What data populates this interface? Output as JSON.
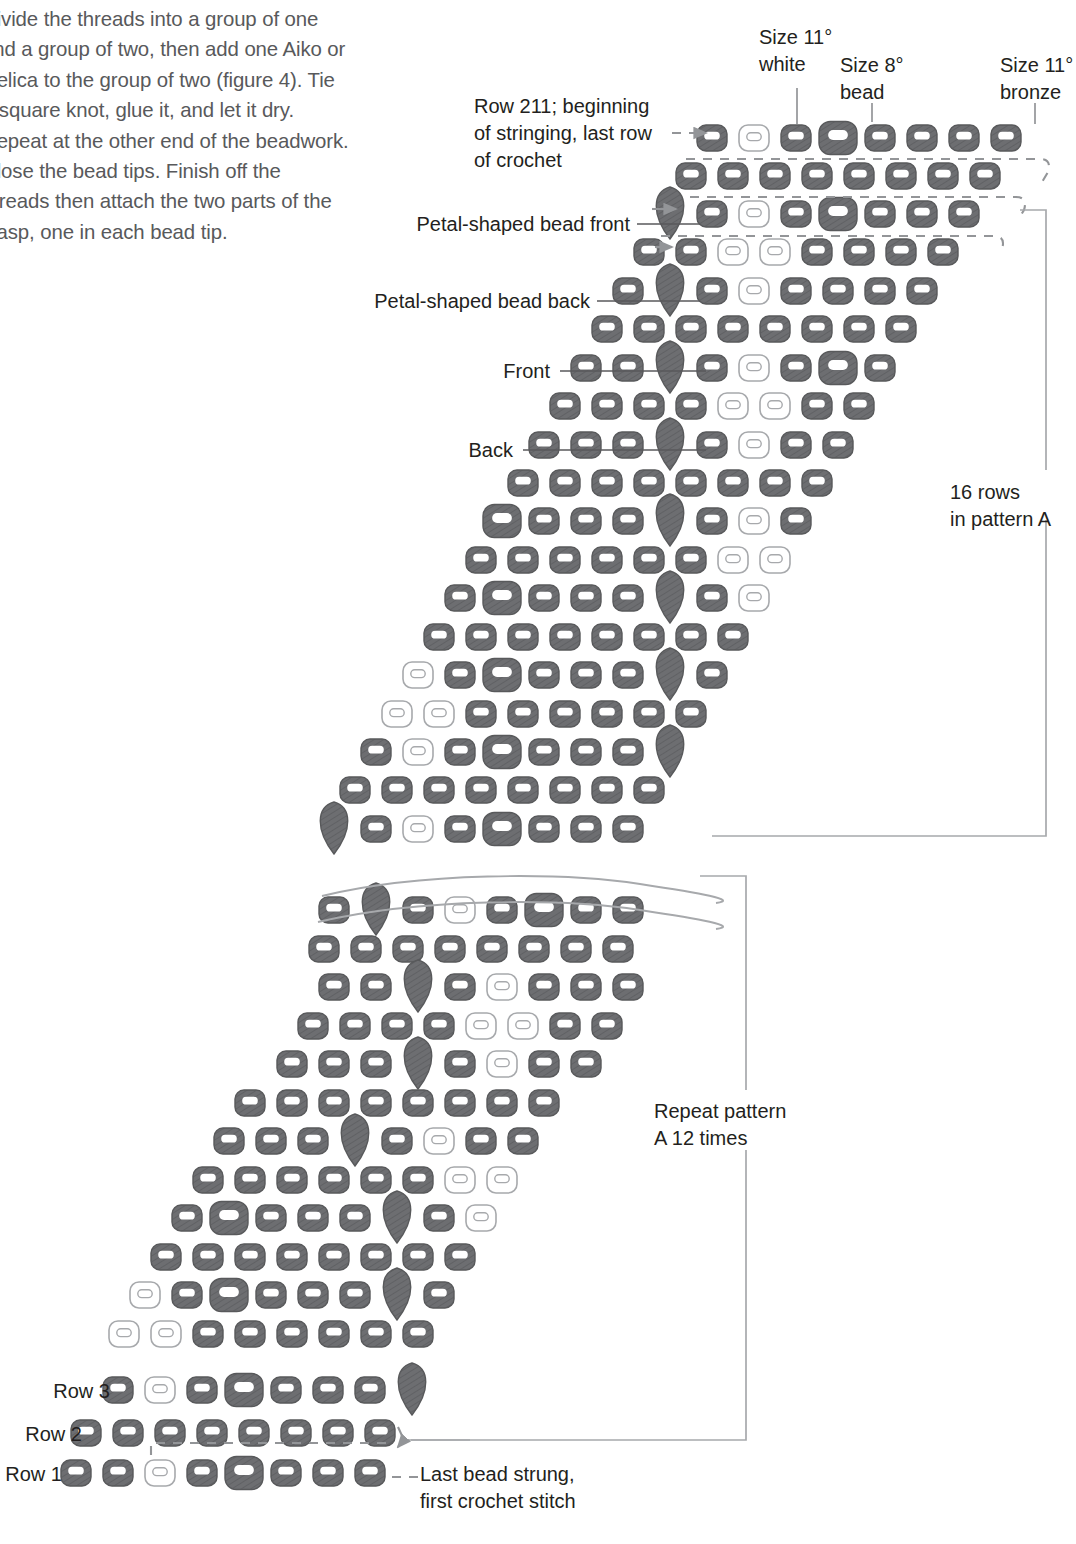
{
  "document": {
    "body_text": "Divide the threads into a group of one and a group of two, then add one Aiko or Delica to the group of two (figure 4). Tie a square knot, glue it, and let it dry. Repeat at the other end of the beadwork. Close the bead tips. Finish off the threads then attach the two parts of the clasp, one in each bead tip."
  },
  "legend": {
    "size11_white": "Size 11°\nwhite",
    "size8_bead": "Size 8°\nbead",
    "size11_bronze": "Size 11°\nbronze"
  },
  "annotations": {
    "row211": "Row 211; beginning\nof stringing, last row\nof crochet",
    "petal_front": "Petal-shaped bead front",
    "petal_back": "Petal-shaped bead back",
    "front": "Front",
    "back": "Back",
    "rows_in_pattern_a": "16 rows\nin pattern A",
    "repeat_pattern": "Repeat pattern\nA 12 times",
    "row3": "Row 3",
    "row2": "Row 2",
    "row1": "Row 1",
    "last_bead": "Last bead strung,\nfirst crochet stitch"
  },
  "colors": {
    "bronze": "#6d6e71",
    "bronze_stroke": "#58595b",
    "white_bead_stroke": "#a7a9ac",
    "white_bead_fill": "#ffffff",
    "rule": "#a7a9ac",
    "dash": "#939598",
    "text": "#231f20",
    "body_text": "#58595b"
  },
  "chart_data": {
    "type": "diagram",
    "bead_types": {
      "B": "size 11 bronze",
      "W": "size 11 white",
      "L": "size 8 bead",
      "P": "petal-shaped bead"
    },
    "row_geometry": {
      "bead_w": 30,
      "bead_h": 26,
      "large_w": 38,
      "large_h": 33,
      "petal_w": 30,
      "petal_h": 52,
      "col_step": 42,
      "row_step": 38,
      "x_shift_per_row": -21
    },
    "rows": [
      {
        "label": "211",
        "y": 138,
        "x0": 712,
        "beads": [
          "B",
          "W",
          "B",
          "L",
          "B",
          "B",
          "B",
          "B"
        ]
      },
      {
        "label": "210",
        "y": 176,
        "x0": 691,
        "beads": [
          "B",
          "B",
          "B",
          "B",
          "B",
          "B",
          "B",
          "B"
        ]
      },
      {
        "label": "209",
        "y": 214,
        "x0": 670,
        "beads": [
          "P",
          "B",
          "W",
          "B",
          "L",
          "B",
          "B",
          "B"
        ]
      },
      {
        "label": "208",
        "y": 252,
        "x0": 649,
        "beads": [
          "B",
          "B",
          "W",
          "W",
          "B",
          "B",
          "B",
          "B"
        ]
      },
      {
        "label": "207",
        "y": 291,
        "x0": 628,
        "beads": [
          "B",
          "P",
          "B",
          "W",
          "B",
          "B",
          "B",
          "B"
        ]
      },
      {
        "label": "206",
        "y": 329,
        "x0": 607,
        "beads": [
          "B",
          "B",
          "B",
          "B",
          "B",
          "B",
          "B",
          "B"
        ]
      },
      {
        "label": "205",
        "y": 368,
        "x0": 586,
        "beads": [
          "B",
          "B",
          "P",
          "B",
          "W",
          "B",
          "L",
          "B"
        ]
      },
      {
        "label": "204",
        "y": 406,
        "x0": 565,
        "beads": [
          "B",
          "B",
          "B",
          "B",
          "W",
          "W",
          "B",
          "B"
        ]
      },
      {
        "label": "203",
        "y": 445,
        "x0": 544,
        "beads": [
          "B",
          "B",
          "B",
          "P",
          "B",
          "W",
          "B",
          "B"
        ]
      },
      {
        "label": "202",
        "y": 483,
        "x0": 523,
        "beads": [
          "B",
          "B",
          "B",
          "B",
          "B",
          "B",
          "B",
          "B"
        ]
      },
      {
        "label": "201",
        "y": 521,
        "x0": 502,
        "beads": [
          "L",
          "B",
          "B",
          "B",
          "P",
          "B",
          "W",
          "B"
        ]
      },
      {
        "label": "200",
        "y": 560,
        "x0": 481,
        "beads": [
          "B",
          "B",
          "B",
          "B",
          "B",
          "B",
          "W",
          "W"
        ]
      },
      {
        "label": "199",
        "y": 598,
        "x0": 460,
        "beads": [
          "B",
          "L",
          "B",
          "B",
          "B",
          "P",
          "B",
          "W"
        ]
      },
      {
        "label": "198",
        "y": 637,
        "x0": 439,
        "beads": [
          "B",
          "B",
          "B",
          "B",
          "B",
          "B",
          "B",
          "B"
        ]
      },
      {
        "label": "197",
        "y": 675,
        "x0": 418,
        "beads": [
          "W",
          "B",
          "L",
          "B",
          "B",
          "B",
          "P",
          "B"
        ]
      },
      {
        "label": "196",
        "y": 714,
        "x0": 397,
        "beads": [
          "W",
          "W",
          "B",
          "B",
          "B",
          "B",
          "B",
          "B"
        ]
      },
      {
        "label": "195",
        "y": 752,
        "x0": 376,
        "beads": [
          "B",
          "W",
          "B",
          "L",
          "B",
          "B",
          "B",
          "P"
        ]
      },
      {
        "label": "194",
        "y": 790,
        "x0": 355,
        "beads": [
          "B",
          "B",
          "B",
          "B",
          "B",
          "B",
          "B",
          "B"
        ]
      },
      {
        "label": "193",
        "y": 829,
        "x0": 334,
        "beads": [
          "P",
          "B",
          "W",
          "B",
          "L",
          "B",
          "B",
          "B"
        ]
      },
      {
        "label": "break-top",
        "y": 872,
        "x0": 0,
        "beads": []
      },
      {
        "label": "28",
        "y": 910,
        "x0": 334,
        "beads": [
          "B",
          "P",
          "B",
          "W",
          "B",
          "L",
          "B",
          "B"
        ]
      },
      {
        "label": "27",
        "y": 949,
        "x0": 324,
        "beads": [
          "B",
          "B",
          "B",
          "B",
          "B",
          "B",
          "B",
          "B"
        ]
      },
      {
        "label": "26",
        "y": 987,
        "x0": 334,
        "beads": [
          "B",
          "B",
          "P",
          "B",
          "W",
          "B",
          "B",
          "B"
        ]
      },
      {
        "label": "25",
        "y": 1026,
        "x0": 313,
        "beads": [
          "B",
          "B",
          "B",
          "B",
          "W",
          "W",
          "B",
          "B"
        ]
      },
      {
        "label": "24",
        "y": 1064,
        "x0": 292,
        "beads": [
          "B",
          "B",
          "B",
          "P",
          "B",
          "W",
          "B",
          "B"
        ]
      },
      {
        "label": "23",
        "y": 1103,
        "x0": 250,
        "beads": [
          "B",
          "B",
          "B",
          "B",
          "B",
          "B",
          "B",
          "B"
        ]
      },
      {
        "label": "22",
        "y": 1141,
        "x0": 229,
        "beads": [
          "B",
          "B",
          "B",
          "P",
          "B",
          "W",
          "B",
          "B"
        ]
      },
      {
        "label": "21",
        "y": 1180,
        "x0": 208,
        "beads": [
          "B",
          "B",
          "B",
          "B",
          "B",
          "B",
          "W",
          "W"
        ]
      },
      {
        "label": "20",
        "y": 1218,
        "x0": 187,
        "beads": [
          "B",
          "L",
          "B",
          "B",
          "B",
          "P",
          "B",
          "W"
        ]
      },
      {
        "label": "19",
        "y": 1257,
        "x0": 166,
        "beads": [
          "B",
          "B",
          "B",
          "B",
          "B",
          "B",
          "B",
          "B"
        ]
      },
      {
        "label": "18",
        "y": 1295,
        "x0": 145,
        "beads": [
          "W",
          "B",
          "L",
          "B",
          "B",
          "B",
          "P",
          "B"
        ]
      },
      {
        "label": "17",
        "y": 1334,
        "x0": 124,
        "beads": [
          "W",
          "W",
          "B",
          "B",
          "B",
          "B",
          "B",
          "B"
        ]
      },
      {
        "label": "3",
        "y": 1390,
        "x0": 118,
        "beads": [
          "B",
          "W",
          "B",
          "L",
          "B",
          "B",
          "B",
          "P"
        ]
      },
      {
        "label": "2",
        "y": 1433,
        "x0": 86,
        "beads": [
          "B",
          "B",
          "B",
          "B",
          "B",
          "B",
          "B",
          "B"
        ]
      },
      {
        "label": "1",
        "y": 1473,
        "x0": 76,
        "beads": [
          "B",
          "B",
          "W",
          "B",
          "L",
          "B",
          "B",
          "B"
        ]
      }
    ]
  }
}
